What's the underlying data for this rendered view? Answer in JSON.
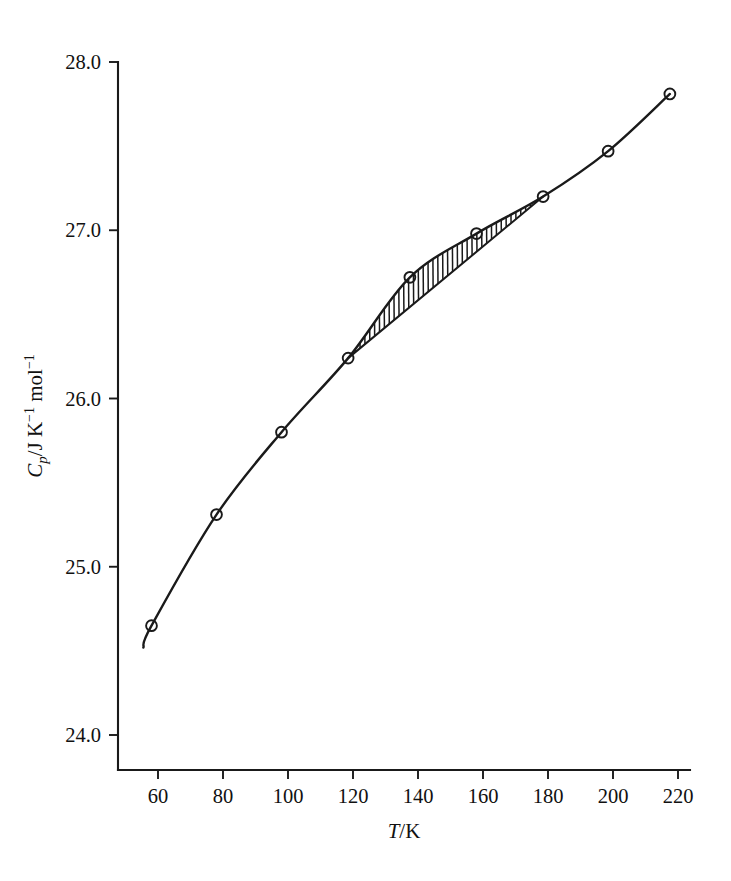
{
  "chart_data": {
    "type": "line",
    "title": "",
    "xlabel": "T/K",
    "ylabel": "Cp/J K-1 mol-1",
    "xlabel_parts": {
      "italic": "T",
      "rest": "/K"
    },
    "ylabel_parts": {
      "italic": "C",
      "sub": "p",
      "mid": "/J K",
      "sup1": "−1",
      "mid2": " mol",
      "sup2": "−1"
    },
    "xlim": [
      50,
      228
    ],
    "ylim": [
      23.6,
      28.1
    ],
    "grid": false,
    "legend": "none",
    "x_ticks": [
      60,
      80,
      100,
      120,
      140,
      160,
      180,
      200,
      220
    ],
    "x_tick_labels": [
      "60",
      "80",
      "100",
      "120",
      "140",
      "160",
      "180",
      "200",
      "220"
    ],
    "y_ticks": [
      24.0,
      25.0,
      26.0,
      27.0,
      28.0
    ],
    "y_tick_labels": [
      "24.0",
      "25.0",
      "26.0",
      "27.0",
      "28.0"
    ],
    "series": [
      {
        "name": "measured heat capacity",
        "marker": "open-circle",
        "x": [
          58,
          78,
          98,
          118.5,
          137.5,
          158,
          178.5,
          198.5,
          217.5
        ],
        "values": [
          24.65,
          25.31,
          25.8,
          26.24,
          26.72,
          26.98,
          27.2,
          27.47,
          27.81
        ]
      },
      {
        "name": "baseline chord",
        "marker": "none",
        "x": [
          118.5,
          178.5
        ],
        "values": [
          26.24,
          27.2
        ]
      }
    ],
    "annotations": [
      {
        "name": "hatched-excess-area",
        "kind": "hatched-region",
        "between": [
          "measured heat capacity",
          "baseline chord"
        ],
        "x_start": 118.5,
        "x_end": 178.5
      }
    ]
  },
  "axes": {
    "x_axis_name": "temperature-axis",
    "y_axis_name": "heat-capacity-axis"
  }
}
